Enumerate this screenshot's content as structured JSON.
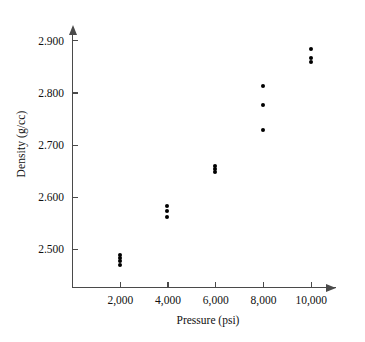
{
  "chart_data": {
    "type": "scatter",
    "title": "",
    "xlabel": "Pressure (psi)",
    "ylabel": "Density (g/cc)",
    "xlim": [
      0,
      11400
    ],
    "ylim": [
      2.425,
      2.935
    ],
    "grid": false,
    "legend": null,
    "xticks": [
      {
        "value": 2000,
        "label": "2,000"
      },
      {
        "value": 4000,
        "label": "4,000"
      },
      {
        "value": 6000,
        "label": "6,000"
      },
      {
        "value": 8000,
        "label": "8,000"
      },
      {
        "value": 10000,
        "label": "10,000"
      }
    ],
    "yticks": [
      {
        "value": 2.5,
        "label": "2.500"
      },
      {
        "value": 2.6,
        "label": "2.600"
      },
      {
        "value": 2.7,
        "label": "2.700"
      },
      {
        "value": 2.8,
        "label": "2.800"
      },
      {
        "value": 2.9,
        "label": "2.900"
      }
    ],
    "marker": "filled-circle",
    "marker_color": "#000000",
    "axis_color": "#4a4a4a",
    "points": [
      {
        "x": 2000,
        "y": 2.488
      },
      {
        "x": 2000,
        "y": 2.482
      },
      {
        "x": 2000,
        "y": 2.476
      },
      {
        "x": 2000,
        "y": 2.47
      },
      {
        "x": 4000,
        "y": 2.583
      },
      {
        "x": 4000,
        "y": 2.572
      },
      {
        "x": 4000,
        "y": 2.561
      },
      {
        "x": 6000,
        "y": 2.659
      },
      {
        "x": 6000,
        "y": 2.653
      },
      {
        "x": 6000,
        "y": 2.648
      },
      {
        "x": 8000,
        "y": 2.812
      },
      {
        "x": 8000,
        "y": 2.775
      },
      {
        "x": 8000,
        "y": 2.728
      },
      {
        "x": 10000,
        "y": 2.883
      },
      {
        "x": 10000,
        "y": 2.866
      },
      {
        "x": 10000,
        "y": 2.859
      }
    ]
  }
}
